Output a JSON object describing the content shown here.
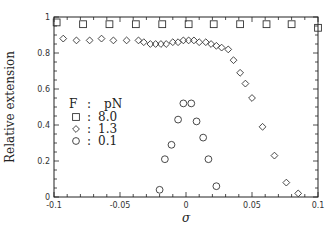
{
  "chart_data": {
    "type": "scatter",
    "title": "",
    "xlabel": "σ",
    "ylabel": "Relative extension",
    "xlim": [
      -0.1,
      0.1
    ],
    "ylim": [
      0,
      1
    ],
    "x_ticks": [
      -0.1,
      -0.05,
      0,
      0.05,
      0.1
    ],
    "x_tick_labels": [
      "-0.1",
      "-0.05",
      "0",
      "0.05",
      "0.1"
    ],
    "y_ticks": [
      0,
      0.2,
      0.4,
      0.6,
      0.8,
      1
    ],
    "y_tick_labels": [
      "0",
      "0.2",
      "0.4",
      "0.6",
      "0.8",
      "1"
    ],
    "grid": false,
    "legend": {
      "title_left": "F",
      "title_sep": ":",
      "title_right": "pN",
      "position": "upper-left-inside",
      "entries": [
        {
          "marker": "square",
          "sep": ":",
          "label": "8.0"
        },
        {
          "marker": "diamond",
          "sep": ":",
          "label": "1.3"
        },
        {
          "marker": "circle",
          "sep": ":",
          "label": "0.1"
        }
      ]
    },
    "series": [
      {
        "name": "8.0 pN",
        "marker": "square",
        "x": [
          -0.098,
          -0.078,
          -0.058,
          -0.038,
          -0.018,
          0.002,
          0.021,
          0.041,
          0.061,
          0.08,
          0.1
        ],
        "y": [
          0.97,
          0.96,
          0.96,
          0.96,
          0.96,
          0.96,
          0.96,
          0.96,
          0.96,
          0.96,
          0.94
        ]
      },
      {
        "name": "1.3 pN",
        "marker": "diamond",
        "x": [
          -0.093,
          -0.083,
          -0.073,
          -0.064,
          -0.055,
          -0.045,
          -0.036,
          -0.032,
          -0.027,
          -0.023,
          -0.019,
          -0.015,
          -0.01,
          -0.006,
          -0.002,
          0.002,
          0.006,
          0.01,
          0.015,
          0.019,
          0.023,
          0.027,
          0.032,
          0.036,
          0.041,
          0.045,
          0.05,
          0.058,
          0.067,
          0.076,
          0.085
        ],
        "y": [
          0.88,
          0.87,
          0.87,
          0.88,
          0.87,
          0.87,
          0.87,
          0.86,
          0.85,
          0.85,
          0.85,
          0.85,
          0.86,
          0.86,
          0.87,
          0.87,
          0.87,
          0.86,
          0.86,
          0.85,
          0.84,
          0.83,
          0.82,
          0.76,
          0.69,
          0.63,
          0.55,
          0.39,
          0.23,
          0.08,
          0.02
        ]
      },
      {
        "name": "0.1 pN",
        "marker": "circle",
        "x": [
          -0.02,
          -0.016,
          -0.011,
          -0.006,
          -0.002,
          0.004,
          0.008,
          0.013,
          0.017,
          0.023
        ],
        "y": [
          0.04,
          0.21,
          0.29,
          0.43,
          0.52,
          0.52,
          0.42,
          0.33,
          0.21,
          0.06
        ]
      }
    ]
  }
}
